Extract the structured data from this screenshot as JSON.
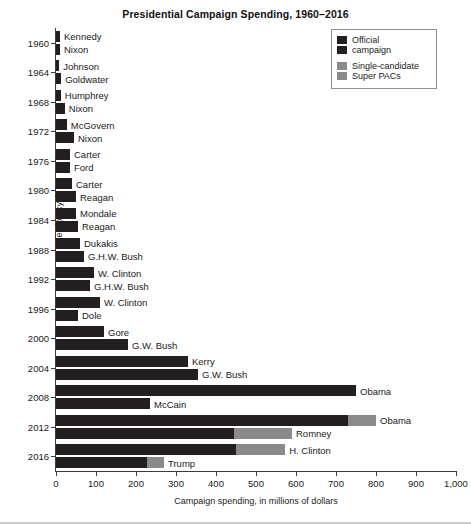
{
  "chart_data": {
    "type": "bar",
    "orientation": "horizontal",
    "title": "Presidential Campaign Spending, 1960–2016",
    "xlabel": "Campaign spending, in millions of dollars",
    "ylabel": "Election cycle",
    "xlim": [
      0,
      1000
    ],
    "xticks": [
      0,
      100,
      200,
      300,
      400,
      500,
      600,
      700,
      800,
      900,
      1000
    ],
    "xtick_labels": [
      "0",
      "100",
      "200",
      "300",
      "400",
      "500",
      "600",
      "700",
      "800",
      "900",
      "1,000"
    ],
    "grid": false,
    "legend_position": "top-right",
    "series": [
      {
        "name": "Official campaign",
        "color": "#231f20"
      },
      {
        "name": "Single-candidate Super PACs",
        "color": "#8a8a8a"
      }
    ],
    "cycles": [
      {
        "year": "1960",
        "candidates": [
          {
            "name": "Kennedy",
            "official": 10,
            "super_pac": 0
          },
          {
            "name": "Nixon",
            "official": 10,
            "super_pac": 0
          }
        ]
      },
      {
        "year": "1964",
        "candidates": [
          {
            "name": "Johnson",
            "official": 8,
            "super_pac": 0
          },
          {
            "name": "Goldwater",
            "official": 13,
            "super_pac": 0
          }
        ]
      },
      {
        "year": "1968",
        "candidates": [
          {
            "name": "Humphrey",
            "official": 12,
            "super_pac": 0
          },
          {
            "name": "Nixon",
            "official": 22,
            "super_pac": 0
          }
        ]
      },
      {
        "year": "1972",
        "candidates": [
          {
            "name": "McGovern",
            "official": 27,
            "super_pac": 0
          },
          {
            "name": "Nixon",
            "official": 45,
            "super_pac": 0
          }
        ]
      },
      {
        "year": "1976",
        "candidates": [
          {
            "name": "Carter",
            "official": 35,
            "super_pac": 0
          },
          {
            "name": "Ford",
            "official": 35,
            "super_pac": 0
          }
        ]
      },
      {
        "year": "1980",
        "candidates": [
          {
            "name": "Carter",
            "official": 40,
            "super_pac": 0
          },
          {
            "name": "Reagan",
            "official": 50,
            "super_pac": 0
          }
        ]
      },
      {
        "year": "1984",
        "candidates": [
          {
            "name": "Mondale",
            "official": 50,
            "super_pac": 0
          },
          {
            "name": "Reagan",
            "official": 55,
            "super_pac": 0
          }
        ]
      },
      {
        "year": "1988",
        "candidates": [
          {
            "name": "Dukakis",
            "official": 60,
            "super_pac": 0
          },
          {
            "name": "G.H.W. Bush",
            "official": 70,
            "super_pac": 0
          }
        ]
      },
      {
        "year": "1992",
        "candidates": [
          {
            "name": "W. Clinton",
            "official": 95,
            "super_pac": 0
          },
          {
            "name": "G.H.W. Bush",
            "official": 85,
            "super_pac": 0
          }
        ]
      },
      {
        "year": "1996",
        "candidates": [
          {
            "name": "W. Clinton",
            "official": 110,
            "super_pac": 0
          },
          {
            "name": "Dole",
            "official": 55,
            "super_pac": 0
          }
        ]
      },
      {
        "year": "2000",
        "candidates": [
          {
            "name": "Gore",
            "official": 120,
            "super_pac": 0
          },
          {
            "name": "G.W. Bush",
            "official": 180,
            "super_pac": 0
          }
        ]
      },
      {
        "year": "2004",
        "candidates": [
          {
            "name": "Kerry",
            "official": 330,
            "super_pac": 0
          },
          {
            "name": "G.W. Bush",
            "official": 355,
            "super_pac": 0
          }
        ]
      },
      {
        "year": "2008",
        "candidates": [
          {
            "name": "Obama",
            "official": 750,
            "super_pac": 0
          },
          {
            "name": "McCain",
            "official": 235,
            "super_pac": 0
          }
        ]
      },
      {
        "year": "2012",
        "candidates": [
          {
            "name": "Obama",
            "official": 730,
            "super_pac": 70
          },
          {
            "name": "Romney",
            "official": 445,
            "super_pac": 145
          }
        ]
      },
      {
        "year": "2016",
        "candidates": [
          {
            "name": "H. Clinton",
            "official": 450,
            "super_pac": 123
          },
          {
            "name": "Trump",
            "official": 228,
            "super_pac": 42
          }
        ]
      }
    ]
  },
  "legend": {
    "entries": [
      {
        "label_line1": "Official",
        "label_line2": "campaign",
        "color": "#231f20"
      },
      {
        "label_line1": "Single-candidate",
        "label_line2": "Super PACs",
        "color": "#8a8a8a"
      }
    ]
  }
}
